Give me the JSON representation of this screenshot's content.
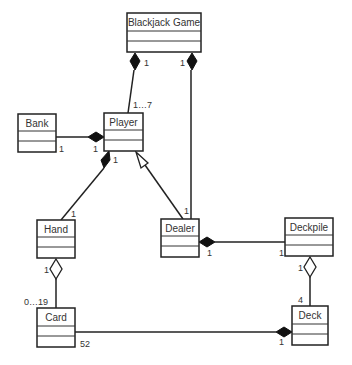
{
  "diagram": {
    "type": "UML class diagram",
    "classes": [
      {
        "id": "blackjack_game",
        "name": "Blackjack Game"
      },
      {
        "id": "bank",
        "name": "Bank"
      },
      {
        "id": "player",
        "name": "Player"
      },
      {
        "id": "hand",
        "name": "Hand"
      },
      {
        "id": "dealer",
        "name": "Dealer"
      },
      {
        "id": "deckpile",
        "name": "Deckpile"
      },
      {
        "id": "card",
        "name": "Card"
      },
      {
        "id": "deck",
        "name": "Deck"
      }
    ],
    "relationships": [
      {
        "from": "Blackjack Game",
        "to": "Player",
        "kind": "composition",
        "whole_mult": "1",
        "part_mult": "1…7"
      },
      {
        "from": "Blackjack Game",
        "to": "Dealer",
        "kind": "composition",
        "whole_mult": "1",
        "part_mult": "1"
      },
      {
        "from": "Player",
        "to": "Bank",
        "kind": "composition",
        "whole_mult": "1",
        "part_mult": "1"
      },
      {
        "from": "Player",
        "to": "Hand",
        "kind": "composition",
        "whole_mult": "1",
        "part_mult": "1"
      },
      {
        "from": "Dealer",
        "to": "Player",
        "kind": "generalization"
      },
      {
        "from": "Dealer",
        "to": "Deckpile",
        "kind": "composition",
        "whole_mult": "1",
        "part_mult": "1"
      },
      {
        "from": "Hand",
        "to": "Card",
        "kind": "aggregation",
        "whole_mult": "1",
        "part_mult": "0…19"
      },
      {
        "from": "Deckpile",
        "to": "Deck",
        "kind": "aggregation",
        "whole_mult": "1",
        "part_mult": "4"
      },
      {
        "from": "Deck",
        "to": "Card",
        "kind": "composition",
        "whole_mult": "1",
        "part_mult": "52"
      }
    ],
    "labels": {
      "bg_player_whole": "1",
      "bg_player_part": "1…7",
      "bg_dealer_whole": "1",
      "bg_dealer_part": "1",
      "bank_part": "1",
      "player_bank_whole": "1",
      "player_hand_whole": "1",
      "player_hand_part": "1",
      "dealer_deckpile_whole": "1",
      "dealer_deckpile_part": "1",
      "hand_card_whole": "1",
      "hand_card_part": "0…19",
      "deckpile_deck_whole": "1",
      "deckpile_deck_part": "4",
      "deck_card_whole": "1",
      "deck_card_part": "52"
    }
  }
}
